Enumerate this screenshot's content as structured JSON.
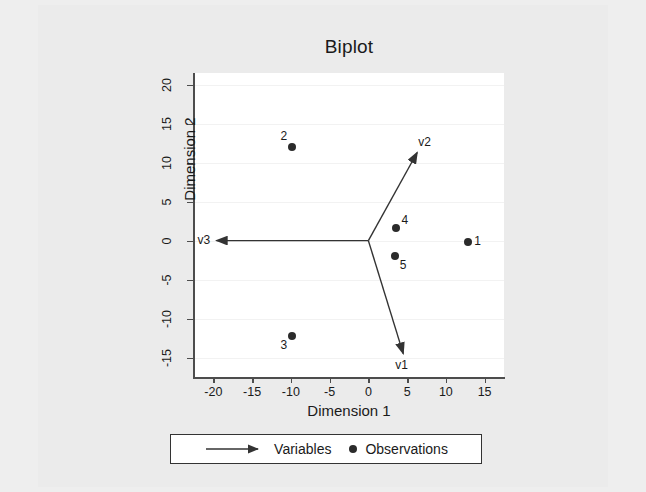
{
  "chart_data": {
    "type": "scatter",
    "title": "Biplot",
    "xlabel": "Dimension 1",
    "ylabel": "Dimension 2",
    "xlim": [
      -22.5,
      17.5
    ],
    "ylim": [
      -17.5,
      21.5
    ],
    "xticks": [
      -20,
      -15,
      -10,
      -5,
      0,
      5,
      10,
      15
    ],
    "xtick_labels": [
      "-20",
      "-15",
      "-10",
      "-5",
      "0",
      "5",
      "10",
      "15"
    ],
    "yticks": [
      -15,
      -10,
      -5,
      0,
      5,
      10,
      15,
      20
    ],
    "ytick_labels": [
      "-15",
      "-10",
      "-5",
      "0",
      "5",
      "10",
      "15",
      "20"
    ],
    "grid": "horizontal",
    "legend_position": "below-axes",
    "observations": [
      {
        "label": "1",
        "x": 12.9,
        "y": -0.2,
        "label_pos": "right"
      },
      {
        "label": "2",
        "x": -9.8,
        "y": 12.0,
        "label_pos": "upper-left"
      },
      {
        "label": "3",
        "x": -9.8,
        "y": -12.3,
        "label_pos": "lower-left"
      },
      {
        "label": "4",
        "x": 3.5,
        "y": 1.6,
        "label_pos": "upper-right"
      },
      {
        "label": "5",
        "x": 3.4,
        "y": -2.0,
        "label_pos": "lower-right"
      }
    ],
    "variables": [
      {
        "label": "v1",
        "x": 4.5,
        "y": -14.5,
        "label_pos": "below"
      },
      {
        "label": "v2",
        "x": 6.3,
        "y": 11.3,
        "label_pos": "above-right"
      },
      {
        "label": "v3",
        "x": -19.6,
        "y": 0.0,
        "label_pos": "left"
      }
    ],
    "origin": {
      "x": 0,
      "y": 0
    }
  },
  "legend": {
    "variables_label": "Variables",
    "observations_label": "Observations"
  },
  "colors": {
    "marker": "#2b2b2b",
    "arrow": "#333333",
    "axis": "#4d4d4d",
    "grid": "#f2f2f2",
    "figure_background": "#ebebeb",
    "plot_background": "#ffffff",
    "text": "#1a1a1a"
  }
}
